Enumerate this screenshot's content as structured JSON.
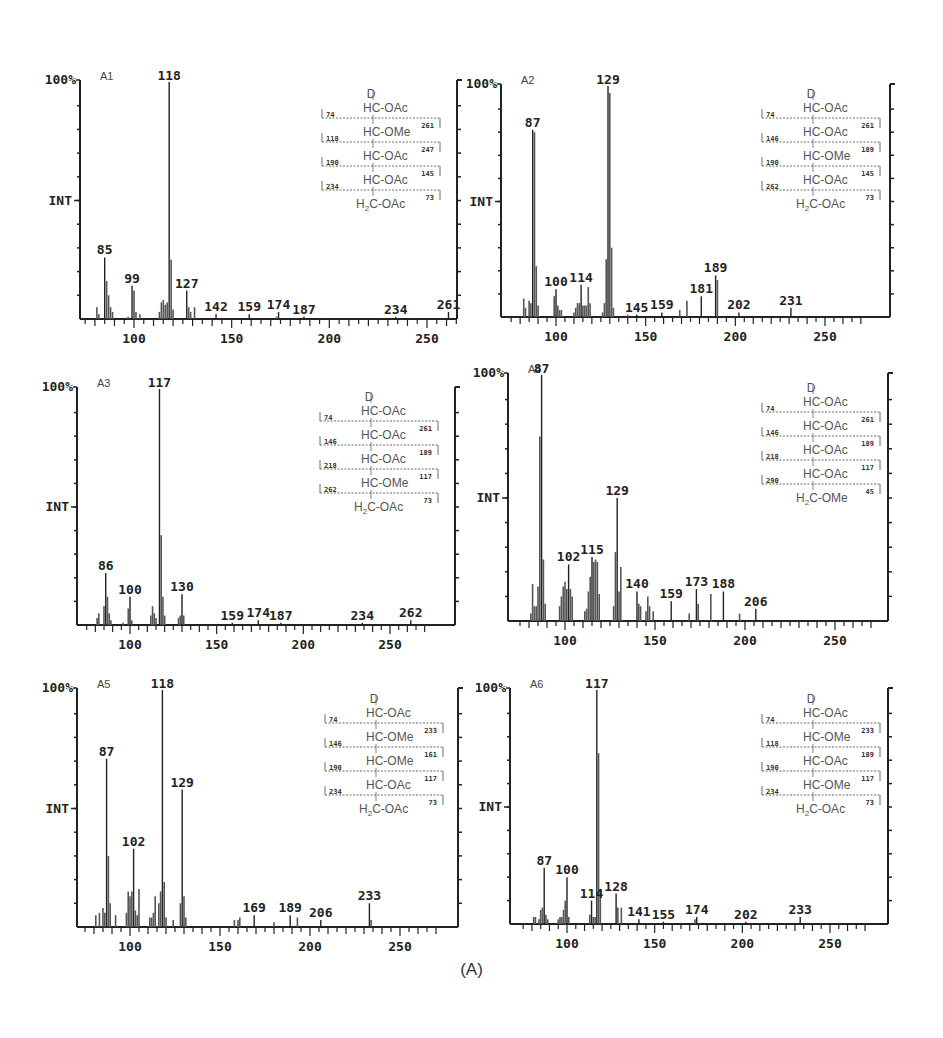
{
  "figure": {
    "caption": "(A)",
    "y_top_label": "100%",
    "y_mid_label": "INT",
    "x_tick_labels": [
      "100",
      "150",
      "200",
      "250"
    ]
  },
  "chart_data": [
    {
      "type": "bar",
      "panel": "A1",
      "title": "A1",
      "xlabel": "m/z",
      "ylabel": "INT",
      "xlim": [
        70,
        280
      ],
      "ylim": [
        0,
        100
      ],
      "x_ticks": [
        100,
        150,
        200,
        250
      ],
      "labeled_peaks": [
        {
          "mz": 85,
          "intensity": 26
        },
        {
          "mz": 99,
          "intensity": 14
        },
        {
          "mz": 118,
          "intensity": 100
        },
        {
          "mz": 127,
          "intensity": 12
        },
        {
          "mz": 142,
          "intensity": 2
        },
        {
          "mz": 159,
          "intensity": 2
        },
        {
          "mz": 174,
          "intensity": 3
        },
        {
          "mz": 187,
          "intensity": 1
        },
        {
          "mz": 234,
          "intensity": 1
        },
        {
          "mz": 261,
          "intensity": 3
        }
      ],
      "minor_peaks": [
        [
          81,
          5
        ],
        [
          82,
          2
        ],
        [
          86,
          16
        ],
        [
          87,
          10
        ],
        [
          88,
          5
        ],
        [
          89,
          3
        ],
        [
          97,
          1
        ],
        [
          100,
          12
        ],
        [
          101,
          3
        ],
        [
          103,
          2
        ],
        [
          113,
          3
        ],
        [
          114,
          7
        ],
        [
          115,
          8
        ],
        [
          116,
          6
        ],
        [
          117,
          7
        ],
        [
          119,
          25
        ],
        [
          120,
          4
        ],
        [
          128,
          5
        ],
        [
          129,
          3
        ],
        [
          131,
          5
        ],
        [
          173,
          1
        ]
      ],
      "structure": {
        "top": "D",
        "rows": [
          "HC-OAc",
          "HC-OMe",
          "HC-OAc",
          "HC-OAc",
          "H2C-OAc"
        ],
        "left_fragments": [
          "74",
          "118",
          "190",
          "234"
        ],
        "right_fragments": [
          "261",
          "247",
          "145",
          "73"
        ]
      }
    },
    {
      "type": "bar",
      "panel": "A2",
      "title": "A2",
      "xlabel": "m/z",
      "ylabel": "INT",
      "xlim": [
        70,
        280
      ],
      "ylim": [
        0,
        100
      ],
      "x_ticks": [
        100,
        150,
        200,
        250
      ],
      "labeled_peaks": [
        {
          "mz": 87,
          "intensity": 81
        },
        {
          "mz": 100,
          "intensity": 12
        },
        {
          "mz": 114,
          "intensity": 14
        },
        {
          "mz": 129,
          "intensity": 100
        },
        {
          "mz": 145,
          "intensity": 1
        },
        {
          "mz": 159,
          "intensity": 2
        },
        {
          "mz": 181,
          "intensity": 9
        },
        {
          "mz": 189,
          "intensity": 18
        },
        {
          "mz": 202,
          "intensity": 2
        },
        {
          "mz": 231,
          "intensity": 4
        }
      ],
      "minor_peaks": [
        [
          82,
          8
        ],
        [
          83,
          4
        ],
        [
          85,
          7
        ],
        [
          86,
          6
        ],
        [
          88,
          80
        ],
        [
          89,
          22
        ],
        [
          90,
          5
        ],
        [
          99,
          9
        ],
        [
          101,
          5
        ],
        [
          102,
          3
        ],
        [
          103,
          3
        ],
        [
          110,
          2
        ],
        [
          111,
          4
        ],
        [
          112,
          6
        ],
        [
          113,
          6
        ],
        [
          115,
          5
        ],
        [
          116,
          5
        ],
        [
          117,
          5
        ],
        [
          118,
          13
        ],
        [
          119,
          6
        ],
        [
          126,
          2
        ],
        [
          127,
          6
        ],
        [
          128,
          25
        ],
        [
          130,
          97
        ],
        [
          131,
          30
        ],
        [
          132,
          4
        ],
        [
          140,
          1
        ],
        [
          169,
          3
        ],
        [
          173,
          7
        ],
        [
          190,
          16
        ]
      ],
      "structure": {
        "top": "D",
        "rows": [
          "HC-OAc",
          "HC-OAc",
          "HC-OMe",
          "HC-OAc",
          "H2C-OAc"
        ],
        "left_fragments": [
          "74",
          "146",
          "190",
          "262"
        ],
        "right_fragments": [
          "261",
          "189",
          "145",
          "73"
        ]
      }
    },
    {
      "type": "bar",
      "panel": "A3",
      "title": "A3",
      "xlabel": "m/z",
      "ylabel": "INT",
      "xlim": [
        70,
        280
      ],
      "ylim": [
        0,
        100
      ],
      "x_ticks": [
        100,
        150,
        200,
        250
      ],
      "labeled_peaks": [
        {
          "mz": 86,
          "intensity": 22
        },
        {
          "mz": 100,
          "intensity": 12
        },
        {
          "mz": 117,
          "intensity": 100
        },
        {
          "mz": 130,
          "intensity": 13
        },
        {
          "mz": 159,
          "intensity": 1
        },
        {
          "mz": 174,
          "intensity": 2
        },
        {
          "mz": 187,
          "intensity": 1
        },
        {
          "mz": 234,
          "intensity": 1
        },
        {
          "mz": 262,
          "intensity": 2
        }
      ],
      "minor_peaks": [
        [
          81,
          3
        ],
        [
          82,
          5
        ],
        [
          85,
          8
        ],
        [
          87,
          12
        ],
        [
          88,
          5
        ],
        [
          89,
          2
        ],
        [
          96,
          1
        ],
        [
          99,
          7
        ],
        [
          101,
          2
        ],
        [
          112,
          4
        ],
        [
          113,
          8
        ],
        [
          114,
          5
        ],
        [
          115,
          3
        ],
        [
          118,
          38
        ],
        [
          119,
          12
        ],
        [
          120,
          4
        ],
        [
          128,
          3
        ],
        [
          129,
          4
        ],
        [
          131,
          4
        ]
      ],
      "structure": {
        "top": "D",
        "rows": [
          "HC-OAc",
          "HC-OAc",
          "HC-OAc",
          "HC-OMe",
          "H2C-OAc"
        ],
        "left_fragments": [
          "74",
          "146",
          "218",
          "262"
        ],
        "right_fragments": [
          "261",
          "189",
          "117",
          "73"
        ]
      }
    },
    {
      "type": "bar",
      "panel": "A4",
      "title": "A4",
      "xlabel": "m/z",
      "ylabel": "INT",
      "xlim": [
        70,
        280
      ],
      "ylim": [
        0,
        100
      ],
      "x_ticks": [
        100,
        150,
        200,
        250
      ],
      "labeled_peaks": [
        {
          "mz": 87,
          "intensity": 100
        },
        {
          "mz": 102,
          "intensity": 23
        },
        {
          "mz": 115,
          "intensity": 26
        },
        {
          "mz": 129,
          "intensity": 50
        },
        {
          "mz": 140,
          "intensity": 12
        },
        {
          "mz": 159,
          "intensity": 8
        },
        {
          "mz": 173,
          "intensity": 13
        },
        {
          "mz": 188,
          "intensity": 12
        },
        {
          "mz": 206,
          "intensity": 5
        }
      ],
      "minor_peaks": [
        [
          81,
          3
        ],
        [
          82,
          15
        ],
        [
          83,
          6
        ],
        [
          84,
          6
        ],
        [
          85,
          14
        ],
        [
          86,
          75
        ],
        [
          88,
          25
        ],
        [
          89,
          7
        ],
        [
          97,
          6
        ],
        [
          98,
          10
        ],
        [
          99,
          14
        ],
        [
          100,
          16
        ],
        [
          101,
          13
        ],
        [
          103,
          13
        ],
        [
          104,
          10
        ],
        [
          111,
          4
        ],
        [
          112,
          5
        ],
        [
          113,
          12
        ],
        [
          114,
          18
        ],
        [
          116,
          24
        ],
        [
          117,
          25
        ],
        [
          118,
          24
        ],
        [
          119,
          11
        ],
        [
          127,
          6
        ],
        [
          128,
          28
        ],
        [
          130,
          12
        ],
        [
          131,
          22
        ],
        [
          141,
          7
        ],
        [
          142,
          6
        ],
        [
          145,
          4
        ],
        [
          146,
          10
        ],
        [
          147,
          6
        ],
        [
          149,
          4
        ],
        [
          169,
          3
        ],
        [
          174,
          7
        ],
        [
          181,
          11
        ],
        [
          197,
          3
        ]
      ],
      "structure": {
        "top": "D",
        "rows": [
          "HC-OAc",
          "HC-OAc",
          "HC-OAc",
          "HC-OAc",
          "H2C-OMe"
        ],
        "left_fragments": [
          "74",
          "146",
          "218",
          "290"
        ],
        "right_fragments": [
          "261",
          "189",
          "117",
          "45"
        ]
      }
    },
    {
      "type": "bar",
      "panel": "A5",
      "title": "A5",
      "xlabel": "m/z",
      "ylabel": "INT",
      "xlim": [
        70,
        280
      ],
      "ylim": [
        0,
        100
      ],
      "x_ticks": [
        100,
        150,
        200,
        250
      ],
      "labeled_peaks": [
        {
          "mz": 87,
          "intensity": 71
        },
        {
          "mz": 102,
          "intensity": 33
        },
        {
          "mz": 118,
          "intensity": 100
        },
        {
          "mz": 129,
          "intensity": 58
        },
        {
          "mz": 169,
          "intensity": 5
        },
        {
          "mz": 189,
          "intensity": 5
        },
        {
          "mz": 206,
          "intensity": 3
        },
        {
          "mz": 233,
          "intensity": 10
        }
      ],
      "minor_peaks": [
        [
          81,
          5
        ],
        [
          83,
          6
        ],
        [
          85,
          8
        ],
        [
          86,
          6
        ],
        [
          88,
          30
        ],
        [
          89,
          10
        ],
        [
          92,
          5
        ],
        [
          98,
          6
        ],
        [
          99,
          15
        ],
        [
          100,
          13
        ],
        [
          101,
          15
        ],
        [
          103,
          7
        ],
        [
          104,
          5
        ],
        [
          105,
          16
        ],
        [
          111,
          4
        ],
        [
          112,
          4
        ],
        [
          113,
          6
        ],
        [
          114,
          13
        ],
        [
          116,
          10
        ],
        [
          117,
          15
        ],
        [
          119,
          19
        ],
        [
          120,
          4
        ],
        [
          124,
          3
        ],
        [
          128,
          10
        ],
        [
          130,
          13
        ],
        [
          131,
          4
        ],
        [
          158,
          3
        ],
        [
          160,
          3
        ],
        [
          161,
          4
        ],
        [
          180,
          2
        ],
        [
          193,
          4
        ],
        [
          234,
          3
        ]
      ],
      "structure": {
        "top": "D",
        "rows": [
          "HC-OAc",
          "HC-OMe",
          "HC-OMe",
          "HC-OAc",
          "H2C-OAc"
        ],
        "left_fragments": [
          "74",
          "146",
          "190",
          "234"
        ],
        "right_fragments": [
          "233",
          "161",
          "117",
          "73"
        ]
      }
    },
    {
      "type": "bar",
      "panel": "A6",
      "title": "A6",
      "xlabel": "m/z",
      "ylabel": "INT",
      "xlim": [
        70,
        280
      ],
      "ylim": [
        0,
        100
      ],
      "x_ticks": [
        100,
        150,
        200,
        250
      ],
      "labeled_peaks": [
        {
          "mz": 87,
          "intensity": 24
        },
        {
          "mz": 100,
          "intensity": 20
        },
        {
          "mz": 114,
          "intensity": 10
        },
        {
          "mz": 117,
          "intensity": 100
        },
        {
          "mz": 128,
          "intensity": 13
        },
        {
          "mz": 141,
          "intensity": 2
        },
        {
          "mz": 155,
          "intensity": 1
        },
        {
          "mz": 174,
          "intensity": 3
        },
        {
          "mz": 202,
          "intensity": 1
        },
        {
          "mz": 233,
          "intensity": 3
        }
      ],
      "minor_peaks": [
        [
          81,
          3
        ],
        [
          82,
          3
        ],
        [
          84,
          2
        ],
        [
          85,
          6
        ],
        [
          86,
          7
        ],
        [
          88,
          4
        ],
        [
          89,
          2
        ],
        [
          95,
          2
        ],
        [
          96,
          3
        ],
        [
          97,
          3
        ],
        [
          98,
          6
        ],
        [
          99,
          10
        ],
        [
          101,
          3
        ],
        [
          113,
          4
        ],
        [
          115,
          3
        ],
        [
          116,
          3
        ],
        [
          118,
          73
        ],
        [
          119,
          15
        ],
        [
          129,
          7
        ],
        [
          131,
          7
        ],
        [
          173,
          2
        ]
      ],
      "structure": {
        "top": "D",
        "rows": [
          "HC-OAc",
          "HC-OMe",
          "HC-OAc",
          "HC-OMe",
          "H2C-OAc"
        ],
        "left_fragments": [
          "74",
          "118",
          "190",
          "234"
        ],
        "right_fragments": [
          "233",
          "189",
          "117",
          "73"
        ]
      }
    }
  ],
  "layout": {
    "panels": [
      {
        "left": 80,
        "top": 82,
        "bottom": 319,
        "right": 457,
        "x100": 134,
        "x250": 427
      },
      {
        "left": 501,
        "top": 86,
        "bottom": 317,
        "right": 890,
        "x100": 556,
        "x250": 825
      },
      {
        "left": 77,
        "top": 389,
        "bottom": 625,
        "right": 455,
        "x100": 130,
        "x250": 390
      },
      {
        "left": 508,
        "top": 375,
        "bottom": 621,
        "right": 888,
        "x100": 565,
        "x250": 835
      },
      {
        "left": 77,
        "top": 690,
        "bottom": 927,
        "right": 458,
        "x100": 130,
        "x250": 400
      },
      {
        "left": 510,
        "top": 690,
        "bottom": 924,
        "right": 888,
        "x100": 567,
        "x250": 830
      }
    ],
    "struct_pos": [
      {
        "x": 322,
        "y": 90
      },
      {
        "x": 762,
        "y": 90
      },
      {
        "x": 320,
        "y": 393
      },
      {
        "x": 762,
        "y": 384
      },
      {
        "x": 325,
        "y": 695
      },
      {
        "x": 762,
        "y": 695
      }
    ],
    "line_color": "#222222",
    "bar_color": "#555555"
  }
}
